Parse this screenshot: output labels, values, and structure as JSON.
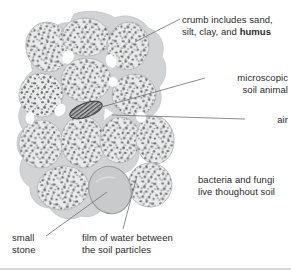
{
  "figure": {
    "background_color": "#ffffff",
    "text_color": "#2b2b2b"
  },
  "labels": {
    "crumb": {
      "line1": "crumb includes sand,",
      "line2_prefix": "silt, clay, and ",
      "line2_bold": "humus"
    },
    "soil_animal": {
      "line1": "microscopic",
      "line2": "soil animal"
    },
    "air": {
      "line1": "air"
    },
    "microbes": {
      "line1": "bacteria and fungi",
      "line2": "live thoughout soil"
    },
    "small_stone": {
      "line1": "small",
      "line2": "stone"
    },
    "water_film": {
      "line1": "film of water between",
      "line2": "the soil particles"
    }
  },
  "diagram": {
    "water_film_color": "#d2d3d4",
    "crumb_fill_color": "#e9eaea",
    "crumb_outline_color": "#b9babb",
    "particle_dark_color": "#6e7072",
    "particle_mid_color": "#9a9c9e",
    "stone_fill_color": "#c9cacb",
    "stone_outline_color": "#9a9c9e",
    "animal_fill_color": "#8e9092",
    "animal_outline_color": "#3c3d3e",
    "leader_line_color": "#6e7072",
    "crumb_count": 12,
    "elements": [
      {
        "name": "crumb",
        "count": 12
      },
      {
        "name": "small-stone",
        "count": 1
      },
      {
        "name": "microscopic-soil-animal",
        "count": 1
      },
      {
        "name": "air-pocket",
        "count": 6
      }
    ]
  }
}
